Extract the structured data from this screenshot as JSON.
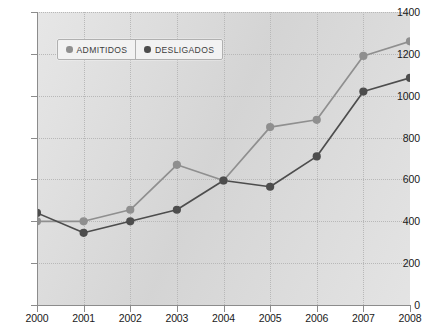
{
  "chart_data": {
    "type": "line",
    "title": "",
    "xlabel": "",
    "ylabel": "",
    "x": [
      2000,
      2001,
      2002,
      2003,
      2004,
      2005,
      2006,
      2007,
      2008
    ],
    "xtick_labels": [
      "2000",
      "2001",
      "2002",
      "2003",
      "2004",
      "2005",
      "2006",
      "2007",
      "2008"
    ],
    "ytick_labels": [
      "0",
      "200",
      "400",
      "600",
      "800",
      "1000",
      "1200",
      "1400"
    ],
    "ytick_values": [
      0,
      200,
      400,
      600,
      800,
      1000,
      1200,
      1400
    ],
    "ylim": [
      0,
      1400
    ],
    "xlim": [
      2000,
      2008
    ],
    "grid": true,
    "legend_position": "top-left",
    "series": [
      {
        "name": "ADMITIDOS",
        "color": "#8f8f8f",
        "values": [
          400,
          400,
          455,
          670,
          595,
          850,
          885,
          1190,
          1260
        ]
      },
      {
        "name": "DESLIGADOS",
        "color": "#4d4d4d",
        "values": [
          440,
          345,
          400,
          455,
          595,
          565,
          710,
          1020,
          1085
        ]
      }
    ]
  },
  "legend": {
    "entries": [
      {
        "label": "ADMITIDOS",
        "dot_color": "#8f8f8f"
      },
      {
        "label": "DESLIGADOS",
        "dot_color": "#4d4d4d"
      }
    ]
  },
  "colors": {
    "plot_background": "#dcdcdc",
    "page_background": "#ffffff",
    "gridline": "#b8b8b8",
    "axis": "#8c8c8c",
    "tick_text": "#1a1a1a",
    "series_admitidos": "#8f8f8f",
    "series_desligados": "#4d4d4d"
  }
}
